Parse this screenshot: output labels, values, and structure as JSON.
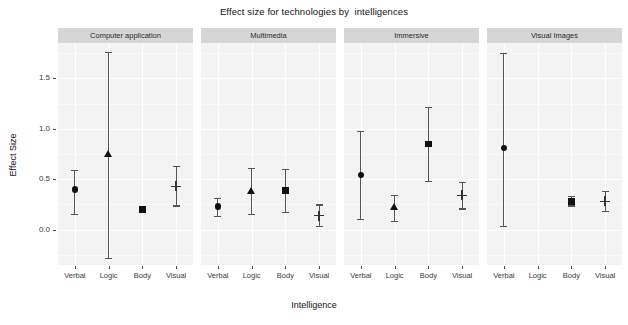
{
  "chart_data": {
    "type": "scatter",
    "title": "Effect size for technologies by  intelligences",
    "xlabel": "Intelligence",
    "ylabel": "Effect Size",
    "ylim": [
      -0.35,
      1.85
    ],
    "yticks": [
      0.0,
      0.5,
      1.0,
      1.5
    ],
    "ytick_labels": [
      "0.0",
      "0.5",
      "1.0",
      "1.5"
    ],
    "grid": true,
    "legend": "none",
    "categories": [
      "Verbal",
      "Logic",
      "Body",
      "Visual"
    ],
    "facet_variable": "technology",
    "facets": [
      {
        "label": "Computer application",
        "points": [
          {
            "category": "Verbal",
            "shape": "circle",
            "value": 0.4,
            "ci_low": 0.16,
            "ci_high": 0.59
          },
          {
            "category": "Logic",
            "shape": "triangle",
            "value": 0.74,
            "ci_low": -0.28,
            "ci_high": 1.76
          },
          {
            "category": "Body",
            "shape": "square",
            "value": 0.2,
            "ci_low": 0.19,
            "ci_high": 0.21
          },
          {
            "category": "Visual",
            "shape": "cross",
            "value": 0.43,
            "ci_low": 0.24,
            "ci_high": 0.63
          }
        ]
      },
      {
        "label": "Multimedia",
        "points": [
          {
            "category": "Verbal",
            "shape": "circle",
            "value": 0.23,
            "ci_low": 0.14,
            "ci_high": 0.31
          },
          {
            "category": "Logic",
            "shape": "triangle",
            "value": 0.38,
            "ci_low": 0.16,
            "ci_high": 0.61
          },
          {
            "category": "Body",
            "shape": "square",
            "value": 0.39,
            "ci_low": 0.18,
            "ci_high": 0.6
          },
          {
            "category": "Visual",
            "shape": "cross",
            "value": 0.14,
            "ci_low": 0.04,
            "ci_high": 0.25
          }
        ]
      },
      {
        "label": "Immersive",
        "points": [
          {
            "category": "Verbal",
            "shape": "circle",
            "value": 0.54,
            "ci_low": 0.11,
            "ci_high": 0.98
          },
          {
            "category": "Logic",
            "shape": "triangle",
            "value": 0.22,
            "ci_low": 0.09,
            "ci_high": 0.34
          },
          {
            "category": "Body",
            "shape": "square",
            "value": 0.85,
            "ci_low": 0.48,
            "ci_high": 1.22
          },
          {
            "category": "Visual",
            "shape": "cross",
            "value": 0.34,
            "ci_low": 0.21,
            "ci_high": 0.47
          }
        ]
      },
      {
        "label": "Visual Images",
        "points": [
          {
            "category": "Verbal",
            "shape": "circle",
            "value": 0.81,
            "ci_low": 0.04,
            "ci_high": 1.75
          },
          {
            "category": "Body",
            "shape": "square",
            "value": 0.28,
            "ci_low": 0.24,
            "ci_high": 0.33
          },
          {
            "category": "Visual",
            "shape": "cross",
            "value": 0.28,
            "ci_low": 0.19,
            "ci_high": 0.38
          }
        ]
      }
    ]
  },
  "colors": {
    "panel_background": "#f3f3f3",
    "strip_background": "#d6d6d6",
    "grid_major": "#ffffff",
    "marker": "#111111",
    "error_bar": "#555555",
    "text": "#1a1a1a"
  }
}
